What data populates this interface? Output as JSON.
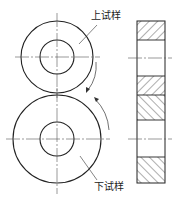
{
  "figure": {
    "labels": {
      "upper_specimen": "上试样",
      "lower_specimen": "下试样"
    },
    "colors": {
      "line": "#222222",
      "center_line": "#555555",
      "background": "#ffffff"
    }
  }
}
